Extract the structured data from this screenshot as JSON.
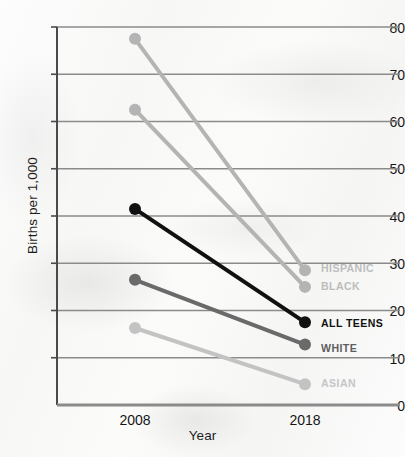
{
  "chart_data": {
    "type": "line",
    "title": "",
    "xlabel": "Year",
    "ylabel": "Births per 1,000",
    "x": [
      2008,
      2018
    ],
    "xtick_labels": [
      "2008",
      "2018"
    ],
    "ylim": [
      0,
      80
    ],
    "ytick_values": [
      0,
      10,
      20,
      30,
      40,
      50,
      60,
      70,
      80
    ],
    "ytick_labels": [
      "0",
      "10",
      "20",
      "30",
      "40",
      "50",
      "60",
      "70",
      "80"
    ],
    "grid": "horizontal",
    "legend_position": "right-inline",
    "series": [
      {
        "name": "HISPANIC",
        "values": [
          77.5,
          28.5
        ],
        "color": "#b4b4b4"
      },
      {
        "name": "BLACK",
        "values": [
          62.5,
          25.0
        ],
        "color": "#b4b4b4"
      },
      {
        "name": "ALL TEENS",
        "values": [
          41.5,
          17.5
        ],
        "color": "#111111"
      },
      {
        "name": "WHITE",
        "values": [
          26.5,
          12.8
        ],
        "color": "#6a6a6a"
      },
      {
        "name": "ASIAN",
        "values": [
          16.3,
          4.4
        ],
        "color": "#c3c3c3"
      }
    ]
  },
  "axes": {
    "y_title": "Births per 1,000",
    "x_title": "Year",
    "y_ticks": [
      "80",
      "70",
      "60",
      "50",
      "40",
      "30",
      "20",
      "10",
      "0"
    ],
    "x_ticks": [
      "2008",
      "2018"
    ]
  },
  "series_labels": {
    "hispanic": "HISPANIC",
    "black": "BLACK",
    "all_teens": "ALL TEENS",
    "white": "WHITE",
    "asian": "ASIAN"
  },
  "colors": {
    "light_gray": "#b4b4b4",
    "pale_gray": "#c3c3c3",
    "mid_gray": "#6a6a6a",
    "black": "#111111",
    "gridline": "#8b8b8b",
    "axis": "#4a4a4a",
    "text": "#161616",
    "label_light": "#bdbdbd",
    "label_mid": "#6a6a6a",
    "label_dark": "#111111"
  }
}
